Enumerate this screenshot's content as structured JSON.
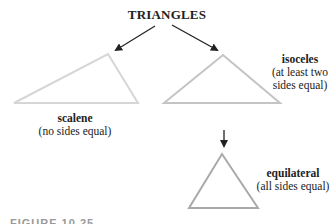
{
  "title": "TRIANGLES",
  "nodes": [
    {
      "name": "scalene",
      "label": "scalene",
      "description": "(no sides equal)",
      "stroke": "#d6d6d6"
    },
    {
      "name": "isoceles",
      "label": "isoceles",
      "description_line1": "(at least two",
      "description_line2": "sides equal)",
      "stroke": "#c4c4c4"
    },
    {
      "name": "equilateral",
      "label": "equilateral",
      "description": "(all sides equal)",
      "stroke": "#a9a9a9"
    }
  ],
  "edges": [
    {
      "from": "TRIANGLES",
      "to": "scalene"
    },
    {
      "from": "TRIANGLES",
      "to": "isoceles"
    },
    {
      "from": "isoceles",
      "to": "equilateral"
    }
  ],
  "caption": "FIGURE 10.25 ..."
}
